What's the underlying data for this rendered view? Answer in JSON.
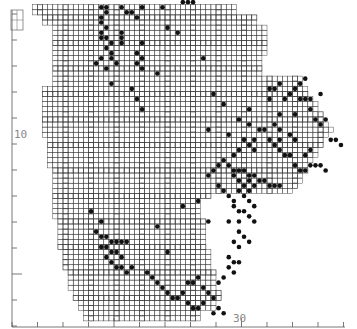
{
  "map": {
    "type": "species distribution dot map",
    "grid_unit": "tetrad",
    "colors": {
      "grid": "#3a3a3a",
      "dot": "#111111",
      "boundary": "#444444",
      "axis": "#555555",
      "label": "#888888"
    },
    "axes": {
      "x_label_text": "30",
      "y_label_text": "10",
      "x_ticks": [
        21,
        22,
        23,
        24,
        25,
        26,
        27,
        28,
        29,
        30,
        31,
        32,
        33,
        34
      ],
      "y_ticks": [
        0,
        1,
        2,
        3,
        4,
        5,
        6,
        7,
        8,
        9,
        10,
        11,
        12
      ],
      "x_major_value": 30,
      "y_major_value": 10
    },
    "extent_rows": [
      [
        62,
        4,
        14,
        68
      ],
      [
        60,
        6,
        16,
        68
      ],
      [
        58,
        8,
        18,
        66
      ],
      [
        56,
        8,
        20,
        64
      ],
      [
        54,
        8,
        22,
        62
      ],
      [
        52,
        8,
        22,
        60
      ],
      [
        50,
        8,
        24,
        58
      ],
      [
        48,
        8,
        26,
        56
      ],
      [
        46,
        6,
        28,
        54
      ],
      [
        44,
        6,
        30,
        52
      ],
      [
        42,
        6,
        32,
        50
      ],
      [
        40,
        6,
        34,
        48
      ],
      [
        38,
        6,
        36,
        46
      ],
      [
        36,
        7,
        36,
        44
      ],
      [
        34,
        7,
        36,
        42
      ],
      [
        32,
        7,
        36,
        40
      ],
      [
        30,
        8,
        32,
        38
      ],
      [
        28,
        8,
        30,
        36
      ],
      [
        26,
        8,
        30,
        34
      ],
      [
        24,
        8,
        28,
        32
      ],
      [
        22,
        8,
        28,
        30
      ],
      [
        20,
        9,
        28,
        28
      ],
      [
        18,
        9,
        28,
        26
      ],
      [
        16,
        9,
        28,
        24
      ],
      [
        14,
        10,
        28,
        22
      ],
      [
        12,
        10,
        28,
        20
      ],
      [
        10,
        11,
        28,
        18
      ],
      [
        8,
        11,
        28,
        16
      ],
      [
        6,
        12,
        28,
        14
      ],
      [
        4,
        13,
        26,
        12
      ],
      [
        2,
        14,
        22,
        10
      ]
    ],
    "dots": [
      [
        17,
        62
      ],
      [
        18,
        62
      ],
      [
        18,
        61
      ],
      [
        17,
        60
      ],
      [
        17,
        59
      ],
      [
        18,
        58
      ],
      [
        17,
        57
      ],
      [
        17,
        56
      ],
      [
        18,
        56
      ],
      [
        19,
        55
      ],
      [
        18,
        54
      ],
      [
        19,
        53
      ],
      [
        21,
        62
      ],
      [
        22,
        61
      ],
      [
        23,
        61
      ],
      [
        25,
        62
      ],
      [
        24,
        60
      ],
      [
        29,
        62
      ],
      [
        33,
        63
      ],
      [
        34,
        63
      ],
      [
        35,
        63
      ],
      [
        30,
        58
      ],
      [
        32,
        57
      ],
      [
        21,
        57
      ],
      [
        21,
        56
      ],
      [
        21,
        55
      ],
      [
        25,
        55
      ],
      [
        24,
        53
      ],
      [
        25,
        52
      ],
      [
        24,
        51
      ],
      [
        25,
        50
      ],
      [
        18,
        50
      ],
      [
        19,
        52
      ],
      [
        20,
        51
      ],
      [
        16,
        51
      ],
      [
        17,
        52
      ],
      [
        19,
        47
      ],
      [
        23,
        46
      ],
      [
        24,
        44
      ],
      [
        25,
        42
      ],
      [
        39,
        45
      ],
      [
        41,
        43
      ],
      [
        37,
        52
      ],
      [
        28,
        49
      ],
      [
        38,
        38
      ],
      [
        42,
        37
      ],
      [
        44,
        40
      ],
      [
        46,
        42
      ],
      [
        46,
        39
      ],
      [
        45,
        36
      ],
      [
        47,
        36
      ],
      [
        46,
        35
      ],
      [
        47,
        34
      ],
      [
        44,
        34
      ],
      [
        43,
        33
      ],
      [
        50,
        46
      ],
      [
        51,
        46
      ],
      [
        52,
        47
      ],
      [
        50,
        44
      ],
      [
        56,
        44
      ],
      [
        57,
        44
      ],
      [
        58,
        44
      ],
      [
        60,
        45
      ],
      [
        58,
        42
      ],
      [
        55,
        41
      ],
      [
        52,
        41
      ],
      [
        48,
        38
      ],
      [
        49,
        38
      ],
      [
        51,
        39
      ],
      [
        52,
        38
      ],
      [
        54,
        37
      ],
      [
        55,
        36
      ],
      [
        50,
        36
      ],
      [
        51,
        35
      ],
      [
        52,
        34
      ],
      [
        53,
        33
      ],
      [
        54,
        33
      ],
      [
        43,
        30
      ],
      [
        44,
        30
      ],
      [
        45,
        30
      ],
      [
        46,
        29
      ],
      [
        47,
        29
      ],
      [
        48,
        28
      ],
      [
        49,
        28
      ],
      [
        50,
        27
      ],
      [
        51,
        27
      ],
      [
        52,
        27
      ],
      [
        46,
        28
      ],
      [
        47,
        27
      ],
      [
        42,
        31
      ],
      [
        43,
        29
      ],
      [
        44,
        28
      ],
      [
        45,
        27
      ],
      [
        46,
        26
      ],
      [
        45,
        25
      ],
      [
        46,
        24
      ],
      [
        47,
        23
      ],
      [
        45,
        22
      ],
      [
        46,
        21
      ],
      [
        47,
        20
      ],
      [
        44,
        22
      ],
      [
        41,
        32
      ],
      [
        40,
        31
      ],
      [
        39,
        30
      ],
      [
        38,
        29
      ],
      [
        40,
        27
      ],
      [
        41,
        26
      ],
      [
        42,
        25
      ],
      [
        43,
        24
      ],
      [
        44,
        26
      ],
      [
        43,
        23
      ],
      [
        42,
        20
      ],
      [
        44,
        20
      ],
      [
        44,
        18
      ],
      [
        45,
        17
      ],
      [
        46,
        16
      ],
      [
        43,
        16
      ],
      [
        44,
        15
      ],
      [
        42,
        13
      ],
      [
        43,
        12
      ],
      [
        44,
        12
      ],
      [
        42,
        11
      ],
      [
        43,
        10
      ],
      [
        41,
        9
      ],
      [
        40,
        8
      ],
      [
        16,
        18
      ],
      [
        17,
        17
      ],
      [
        18,
        17
      ],
      [
        19,
        16
      ],
      [
        20,
        16
      ],
      [
        21,
        16
      ],
      [
        22,
        16
      ],
      [
        17,
        15
      ],
      [
        18,
        15
      ],
      [
        19,
        14
      ],
      [
        20,
        14
      ],
      [
        21,
        13
      ],
      [
        18,
        13
      ],
      [
        19,
        12
      ],
      [
        20,
        11
      ],
      [
        21,
        11
      ],
      [
        22,
        10
      ],
      [
        17,
        20
      ],
      [
        15,
        22
      ],
      [
        23,
        11
      ],
      [
        26,
        10
      ],
      [
        27,
        9
      ],
      [
        28,
        8
      ],
      [
        29,
        7
      ],
      [
        30,
        6
      ],
      [
        31,
        5
      ],
      [
        32,
        5
      ],
      [
        33,
        6
      ],
      [
        34,
        4
      ],
      [
        35,
        3
      ],
      [
        36,
        3
      ],
      [
        34,
        8
      ],
      [
        35,
        8
      ],
      [
        36,
        9
      ],
      [
        38,
        6
      ],
      [
        39,
        5
      ],
      [
        37,
        4
      ],
      [
        30,
        14
      ],
      [
        33,
        23
      ],
      [
        36,
        24
      ],
      [
        38,
        20
      ],
      [
        28,
        19
      ],
      [
        37,
        7
      ],
      [
        40,
        3
      ],
      [
        39,
        2
      ],
      [
        41,
        2
      ],
      [
        56,
        47
      ],
      [
        57,
        48
      ],
      [
        54,
        45
      ],
      [
        55,
        46
      ],
      [
        53,
        44
      ],
      [
        59,
        40
      ],
      [
        60,
        39
      ],
      [
        61,
        40
      ],
      [
        62,
        36
      ],
      [
        63,
        36
      ],
      [
        64,
        35
      ],
      [
        55,
        31
      ],
      [
        56,
        30
      ],
      [
        57,
        30
      ],
      [
        58,
        31
      ],
      [
        59,
        31
      ],
      [
        60,
        31
      ],
      [
        61,
        30
      ],
      [
        58,
        34
      ],
      [
        57,
        33
      ],
      [
        52,
        36
      ]
    ]
  }
}
